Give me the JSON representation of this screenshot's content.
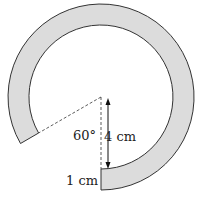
{
  "diagram": {
    "angle_label": "60°",
    "height_label": "4 cm",
    "width_label": "1 cm",
    "colors": {
      "ring_fill": "#dcdcdc",
      "stroke": "#333333"
    }
  }
}
